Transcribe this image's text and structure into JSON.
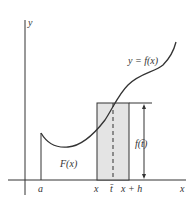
{
  "diagram": {
    "axes": {
      "x_label": "x",
      "y_label": "y"
    },
    "curve_label": "y = f(x)",
    "area_label": "F(x)",
    "height_label": "f(t̄)",
    "tick_labels": {
      "a": "a",
      "x": "x",
      "tbar": "t̄",
      "xh": "x + h"
    },
    "colors": {
      "axis": "#333333",
      "curve": "#333333",
      "rect_fill": "#e4e4e4"
    }
  }
}
